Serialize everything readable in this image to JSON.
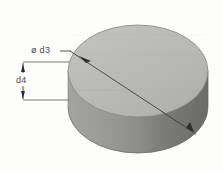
{
  "figure": {
    "type": "technical-drawing",
    "background_color": "#fdfdfc",
    "width": 222,
    "height": 171
  },
  "labels": {
    "diameter": "ø d3",
    "height": "d4"
  },
  "solid": {
    "name": "cylinder",
    "top_face": {
      "name": "top-elliptical-face",
      "fill": "#b9b9b7",
      "center_x": 138,
      "center_y": 71,
      "radius_x": 70,
      "radius_y": 46
    },
    "side_wall": {
      "name": "cylindrical-side-wall",
      "fill_left": "#9a9a98",
      "fill_right": "#6f6f6e",
      "height_px": 36
    },
    "outline_color": "#777775"
  },
  "dimensions": {
    "diameter_leader": {
      "name": "diameter-leader-line",
      "color": "#3c3c3c",
      "label": "ø d3",
      "start_x": 60,
      "start_y": 51,
      "bend_x": 70,
      "bend_y": 51,
      "end_x": 196,
      "end_y": 134
    },
    "height_dimension": {
      "name": "height-dimension-line",
      "color": "#3c3c3c",
      "label": "d4",
      "line_x": 23,
      "top_y": 62,
      "bottom_y": 100,
      "extension_start_x": 23,
      "extension_end_x": 69
    }
  }
}
